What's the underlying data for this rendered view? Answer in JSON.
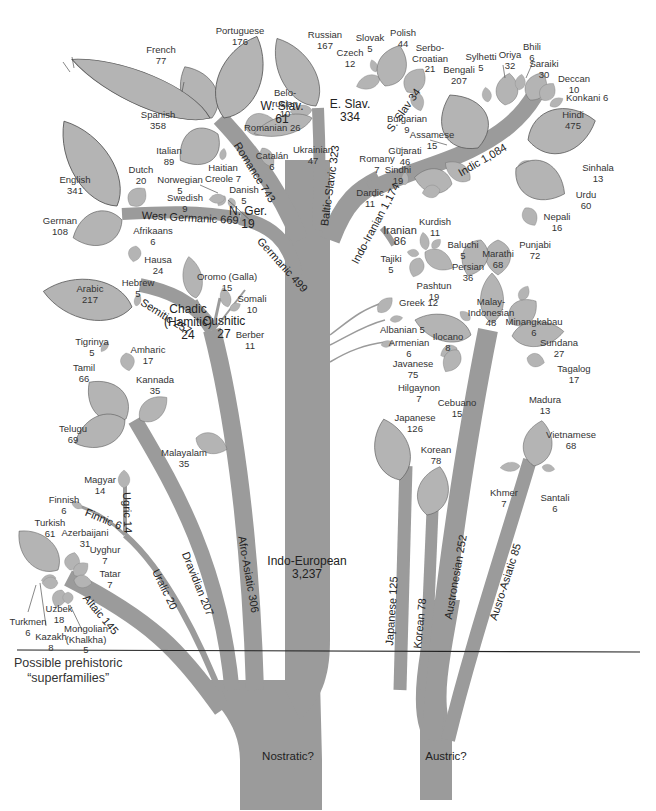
{
  "note": {
    "line1": "Possible prehistoric",
    "line2": "“superfamilies”"
  },
  "roots": {
    "nostratic": "Nostratic?",
    "austric": "Austric?"
  },
  "colors": {
    "stem": "#9b9b9b",
    "leaf": "#b4b4b4",
    "outline": "#555555",
    "line": "#222222"
  },
  "branches": {
    "indo_european": {
      "name": "Indo-European",
      "value": "3,237"
    },
    "romance": "Romance 743",
    "baltic_slavic": "Baltic-Slavic 323",
    "indo_iranian": "Indo-Iranian 1,174",
    "indic": "Indic 1,084",
    "west_germanic": "West Germanic 669",
    "germanic": "Germanic 499",
    "semitic": "Semitic 257",
    "afro_asiatic": "Afro-Asiatic 306",
    "dravidian": "Dravidian 207",
    "uralic": "Uralic 20",
    "ugric": "Ugric 14",
    "finnic": "Finnic 6",
    "altaic": "Altaic 145",
    "japanese": "Japanese 125",
    "korean": "Korean 78",
    "austronesian": "Austronesian 252",
    "austro_asiatic": "Ausro-Asiatic 85",
    "e_slav": {
      "name": "E. Slav.",
      "value": "334"
    },
    "w_slav": {
      "name": "W. Slav.",
      "value": "61"
    },
    "s_slav": "S. Slav 34",
    "n_ger": {
      "name": "N. Ger.",
      "value": "19"
    },
    "iranian": {
      "name": "Iranian",
      "value": "86"
    },
    "chadic": {
      "name": "Chadic",
      "name2": "(Hamitic)",
      "value": "24"
    },
    "cushitic": {
      "name": "Cushitic",
      "value": "27"
    }
  },
  "languages": {
    "french": {
      "name": "French",
      "value": "77"
    },
    "portuguese": {
      "name": "Portuguese",
      "value": "176"
    },
    "spanish": {
      "name": "Spanish",
      "value": "358"
    },
    "italian": {
      "name": "Italian",
      "value": "89"
    },
    "romanian": "Romanian 26",
    "catalan": {
      "name": "Catalán",
      "value": "6"
    },
    "haitian": {
      "name": "Haitian",
      "value": "Creole 7"
    },
    "english": {
      "name": "English",
      "value": "341"
    },
    "dutch": {
      "name": "Dutch",
      "value": "20"
    },
    "german": {
      "name": "German",
      "value": "108"
    },
    "afrikaans": {
      "name": "Afrikaans",
      "value": "6"
    },
    "norwegian": {
      "name": "Norwegian",
      "value": "5"
    },
    "swedish": {
      "name": "Swedish",
      "value": "9"
    },
    "danish": {
      "name": "Danish",
      "value": "5"
    },
    "russian": {
      "name": "Russian",
      "value": "167"
    },
    "belorusian": {
      "name": "Belo-",
      "name2": "rusian",
      "value": "10"
    },
    "ukrainian": {
      "name": "Ukrainian",
      "value": "47"
    },
    "slovak": {
      "name": "Slovak",
      "value": "5"
    },
    "czech": {
      "name": "Czech",
      "value": "12"
    },
    "polish": {
      "name": "Polish",
      "value": "44"
    },
    "serbo_croatian": {
      "name": "Serbo-",
      "name2": "Croatian",
      "value": "21"
    },
    "bulgarian": {
      "name": "Bulgarian",
      "value": "9"
    },
    "romany": {
      "name": "Romany",
      "value": "7"
    },
    "dardic": {
      "name": "Dardic",
      "value": "11"
    },
    "bengali": {
      "name": "Bengali",
      "value": "207"
    },
    "sylhetti": {
      "name": "Sylhetti",
      "value": "5"
    },
    "oriya": {
      "name": "Oriya",
      "value": "32"
    },
    "bhili": {
      "name": "Bhili",
      "value": "6"
    },
    "saraiki": {
      "name": "Saraiki",
      "value": "30"
    },
    "deccan": {
      "name": "Deccan",
      "value": "10"
    },
    "konkani": "Konkani 6",
    "hindi": {
      "name": "Hindi",
      "value": "475"
    },
    "assamese": {
      "name": "Assamese",
      "value": "15"
    },
    "gujarati": {
      "name": "Gujarati",
      "value": "46"
    },
    "sindhi": {
      "name": "Sindhi",
      "value": "19"
    },
    "sinhala": {
      "name": "Sinhala",
      "value": "13"
    },
    "urdu": {
      "name": "Urdu",
      "value": "60"
    },
    "nepali": {
      "name": "Nepali",
      "value": "16"
    },
    "punjabi": {
      "name": "Punjabi",
      "value": "72"
    },
    "marathi": {
      "name": "Marathi",
      "value": "68"
    },
    "kurdish": {
      "name": "Kurdish",
      "value": "11"
    },
    "baluchi": {
      "name": "Baluchi",
      "value": "5"
    },
    "tajiki": {
      "name": "Tajiki",
      "value": "5"
    },
    "persian": {
      "name": "Persian",
      "value": "36"
    },
    "pashtun": {
      "name": "Pashtun",
      "value": "19"
    },
    "greek": "Greek 12",
    "albanian": "Albanian 5",
    "armenian": {
      "name": "Armenian",
      "value": "6"
    },
    "hausa": {
      "name": "Hausa",
      "value": "24"
    },
    "oromo": {
      "name": "Oromo (Galla)",
      "value": "15"
    },
    "somali": {
      "name": "Somali",
      "value": "10"
    },
    "berber": {
      "name": "Berber",
      "value": "11"
    },
    "arabic": {
      "name": "Arabic",
      "value": "217"
    },
    "hebrew": {
      "name": "Hebrew",
      "value": "5"
    },
    "tigrinya": {
      "name": "Tigrinya",
      "value": "5"
    },
    "amharic": {
      "name": "Amharic",
      "value": "17"
    },
    "tamil": {
      "name": "Tamil",
      "value": "66"
    },
    "kannada": {
      "name": "Kannada",
      "value": "35"
    },
    "telugu": {
      "name": "Telugu",
      "value": "69"
    },
    "malayalam": {
      "name": "Malayalam",
      "value": "35"
    },
    "magyar": {
      "name": "Magyar",
      "value": "14"
    },
    "finnish": {
      "name": "Finnish",
      "value": "6"
    },
    "turkish": {
      "name": "Turkish",
      "value": "61"
    },
    "azerbaijani": {
      "name": "Azerbaijani",
      "value": "31"
    },
    "uyghur": {
      "name": "Uyghur",
      "value": "7"
    },
    "tatar": {
      "name": "Tatar",
      "value": "7"
    },
    "uzbek": {
      "name": "Uzbek",
      "value": "18"
    },
    "turkmen": {
      "name": "Turkmen",
      "value": "6"
    },
    "kazakh": {
      "name": "Kazakh",
      "value": "8"
    },
    "mongolian": {
      "name": "Mongolian",
      "name2": "(Khalkha)",
      "value": "5"
    },
    "malay": {
      "name": "Malay-",
      "name2": "Indonesian",
      "value": "48"
    },
    "minangkabau": {
      "name": "Minangkabau",
      "value": "6"
    },
    "ilocano": {
      "name": "Ilocano",
      "value": "8"
    },
    "sundana": {
      "name": "Sundana",
      "value": "27"
    },
    "javanese": {
      "name": "Javanese",
      "value": "75"
    },
    "tagalog": {
      "name": "Tagalog",
      "value": "17"
    },
    "hilgaynon": {
      "name": "Hilgaynon",
      "value": "7"
    },
    "cebuano": {
      "name": "Cebuano",
      "value": "15"
    },
    "madura": {
      "name": "Madura",
      "value": "13"
    },
    "japanese": {
      "name": "Japanese",
      "value": "126"
    },
    "korean": {
      "name": "Korean",
      "value": "78"
    },
    "vietnamese": {
      "name": "Vietnamese",
      "value": "68"
    },
    "khmer": {
      "name": "Khmer",
      "value": "7"
    },
    "santali": {
      "name": "Santali",
      "value": "6"
    }
  }
}
